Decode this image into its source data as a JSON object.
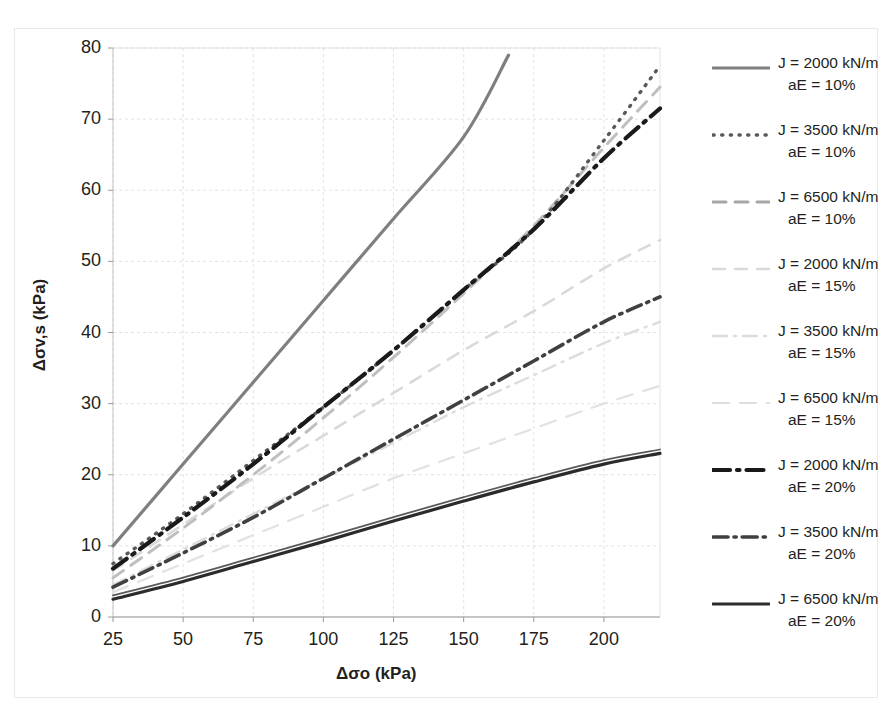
{
  "chart_data": {
    "type": "line",
    "title": "",
    "xlabel": "Δσo (kPa)",
    "ylabel": "Δσv,s (kPa)",
    "xlim": [
      25,
      220
    ],
    "ylim": [
      0,
      80
    ],
    "xticks": [
      25,
      50,
      75,
      100,
      125,
      150,
      175,
      200
    ],
    "yticks": [
      0,
      10,
      20,
      30,
      40,
      50,
      60,
      70,
      80
    ],
    "grid": true,
    "legend_position": "right",
    "x": [
      25,
      50,
      75,
      100,
      125,
      150,
      175,
      200,
      220
    ],
    "series": [
      {
        "name": "J = 2000 kN/m aE = 10%",
        "J": 2000,
        "aE": "10%",
        "style": "solid",
        "color": "#7f7f7f",
        "width": 3.2,
        "values": [
          10.0,
          21.5,
          33.0,
          44.5,
          56.0,
          67.5,
          null,
          null,
          null
        ],
        "x_end": 166,
        "y_end": 79.0
      },
      {
        "name": "J = 3500 kN/m aE = 10%",
        "J": 3500,
        "aE": "10%",
        "style": "dotted",
        "color": "#595959",
        "width": 3.4,
        "values": [
          7.5,
          14.5,
          22.0,
          29.5,
          37.5,
          46.0,
          54.5,
          67.0,
          77.5
        ]
      },
      {
        "name": "J = 6500 kN/m aE = 10%",
        "J": 6500,
        "aE": "10%",
        "style": "dashed",
        "color": "#bfbfbf",
        "width": 3.0,
        "values": [
          5.5,
          12.5,
          20.0,
          28.0,
          36.5,
          45.5,
          55.0,
          66.0,
          74.5
        ]
      },
      {
        "name": "J = 2000 kN/m aE = 15%",
        "J": 2000,
        "aE": "15%",
        "style": "dashed-light",
        "color": "#d9d9d9",
        "width": 2.6,
        "values": [
          6.5,
          13.0,
          19.5,
          25.5,
          31.5,
          37.5,
          43.0,
          49.0,
          53.0
        ]
      },
      {
        "name": "J = 3500 kN/m aE = 15%",
        "J": 3500,
        "aE": "15%",
        "style": "dash-dot-light",
        "color": "#dcdcdc",
        "width": 2.4,
        "values": [
          4.5,
          9.5,
          14.5,
          19.5,
          24.5,
          29.5,
          34.0,
          38.5,
          41.5
        ]
      },
      {
        "name": "J = 6500 kN/m aE = 15%",
        "J": 6500,
        "aE": "15%",
        "style": "long-dash-light",
        "color": "#e2e2e2",
        "width": 2.2,
        "values": [
          3.5,
          7.5,
          11.5,
          15.5,
          19.5,
          23.0,
          26.5,
          30.0,
          32.5
        ]
      },
      {
        "name": "J = 2000 kN/m aE = 20%",
        "J": 2000,
        "aE": "20%",
        "style": "dash-dot",
        "color": "#1a1a1a",
        "width": 4.2,
        "values": [
          6.8,
          14.0,
          21.5,
          29.5,
          37.5,
          46.0,
          54.5,
          64.5,
          71.5
        ]
      },
      {
        "name": "J = 3500 kN/m aE = 20%",
        "J": 3500,
        "aE": "20%",
        "style": "dash-dot-dark",
        "color": "#404040",
        "width": 3.6,
        "values": [
          4.2,
          9.0,
          14.0,
          19.5,
          25.0,
          30.5,
          36.0,
          41.5,
          45.0
        ]
      },
      {
        "name": "J = 6500 kN/m aE = 20%",
        "J": 6500,
        "aE": "20%",
        "style": "solid-dark",
        "color": "#2b2b2b",
        "width": 3.2,
        "values": [
          2.5,
          5.0,
          7.8,
          10.6,
          13.5,
          16.3,
          19.0,
          21.5,
          23.0
        ]
      }
    ]
  },
  "axes": {
    "x_title": "Δσo (kPa)",
    "y_title": "Δσv,s (kPa)",
    "x_labels": [
      "25",
      "50",
      "75",
      "100",
      "125",
      "150",
      "175",
      "200"
    ],
    "y_labels": [
      "0",
      "10",
      "20",
      "30",
      "40",
      "50",
      "60",
      "70",
      "80"
    ]
  },
  "legend": {
    "items": [
      {
        "line1": "J = 2000 kN/m",
        "line2": "aE = 10%",
        "style": "solid",
        "color": "#7f7f7f"
      },
      {
        "line1": "J = 3500 kN/m",
        "line2": "aE = 10%",
        "style": "dotted",
        "color": "#595959"
      },
      {
        "line1": "J = 6500 kN/m",
        "line2": "aE = 10%",
        "style": "dashed",
        "color": "#a6a6a6"
      },
      {
        "line1": "J = 2000 kN/m",
        "line2": "aE = 15%",
        "style": "dashed-light",
        "color": "#d9d9d9"
      },
      {
        "line1": "J = 3500 kN/m",
        "line2": "aE = 15%",
        "style": "dash-dot-light",
        "color": "#dcdcdc"
      },
      {
        "line1": "J = 6500 kN/m",
        "line2": "aE = 15%",
        "style": "long-dash-light",
        "color": "#dedede"
      },
      {
        "line1": "J = 2000 kN/m",
        "line2": "aE = 20%",
        "style": "dash-dot",
        "color": "#1a1a1a"
      },
      {
        "line1": "J = 3500 kN/m",
        "line2": "aE = 20%",
        "style": "dash-dot-dark",
        "color": "#404040"
      },
      {
        "line1": "J = 6500 kN/m",
        "line2": "aE = 20%",
        "style": "solid-dark",
        "color": "#2b2b2b"
      }
    ]
  },
  "colors": {
    "grid": "#d6d6d6",
    "axis": "#bdbdbd",
    "text": "#231f20",
    "background": "#ffffff"
  }
}
